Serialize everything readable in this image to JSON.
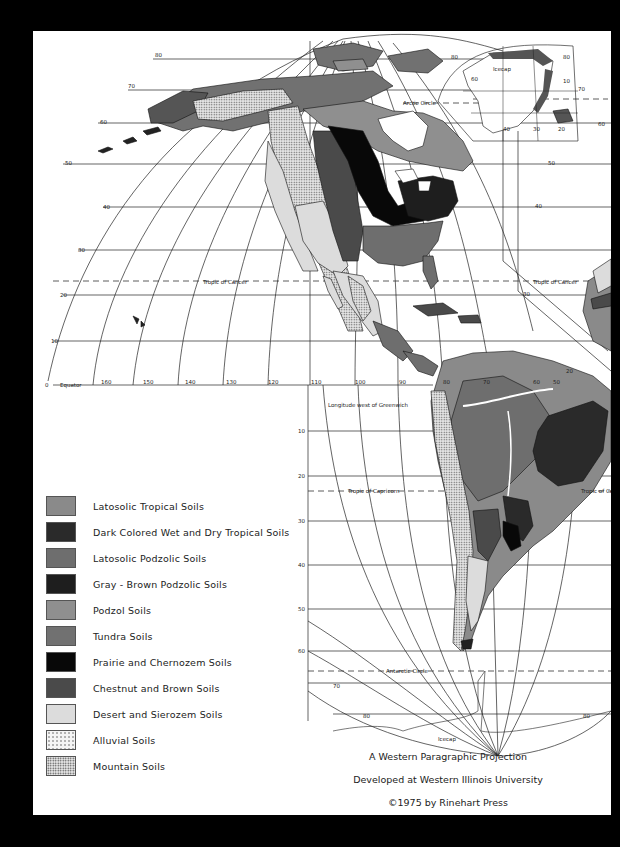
{
  "map": {
    "title": "A Western Paragraphic Projection",
    "institution": "Developed at Western Illinois University",
    "copyright": "©1975 by Rinehart Press",
    "longitude_caption": "Longitude west of Greenwich",
    "reference_lines": {
      "equator": "Equator",
      "tropic_of_cancer": "Tropic of Cancer",
      "tropic_of_capricorn": "Tropic of Capricorn",
      "arctic_circle": "Arctic Circle",
      "antarctic_circle": "Antarctic Circle"
    },
    "features": {
      "greenland_icecap": "Icecap",
      "antarctic_icecap": "Icecap"
    },
    "latitude_labels_north": [
      "80",
      "70",
      "60",
      "50",
      "40",
      "30",
      "20",
      "10",
      "0"
    ],
    "latitude_labels_south": [
      "10",
      "20",
      "30",
      "40",
      "50",
      "60",
      "70",
      "80"
    ],
    "longitude_labels": [
      "160",
      "150",
      "140",
      "130",
      "120",
      "110",
      "100",
      "90",
      "80",
      "70",
      "60",
      "50"
    ],
    "greenland_inset_labels": [
      "80",
      "60",
      "80",
      "10",
      "70",
      "40",
      "30",
      "20",
      "60"
    ],
    "right_panel_labels": [
      "50",
      "40",
      "30",
      "20",
      "10",
      "10"
    ]
  },
  "legend": {
    "items": [
      {
        "label": "Latosolic Tropical Soils",
        "color": "#8a8a8a",
        "pattern": "solid"
      },
      {
        "label": "Dark Colored Wet and Dry Tropical Soils",
        "color": "#2a2a2a",
        "pattern": "solid"
      },
      {
        "label": "Latosolic Podzolic Soils",
        "color": "#6e6e6e",
        "pattern": "solid"
      },
      {
        "label": "Gray - Brown Podzolic Soils",
        "color": "#1e1e1e",
        "pattern": "solid"
      },
      {
        "label": "Podzol Soils",
        "color": "#8f8f8f",
        "pattern": "solid"
      },
      {
        "label": "Tundra Soils",
        "color": "#717171",
        "pattern": "solid"
      },
      {
        "label": "Prairie and Chernozem Soils",
        "color": "#080808",
        "pattern": "solid"
      },
      {
        "label": "Chestnut and Brown Soils",
        "color": "#4a4a4a",
        "pattern": "solid"
      },
      {
        "label": "Desert and Sierozem Soils",
        "color": "#dcdcdc",
        "pattern": "solid"
      },
      {
        "label": "Alluvial Soils",
        "color": "#f4f4f4",
        "pattern": "sparse-dots"
      },
      {
        "label": "Mountain Soils",
        "color": "#d0d0d0",
        "pattern": "dense-dots"
      }
    ]
  }
}
